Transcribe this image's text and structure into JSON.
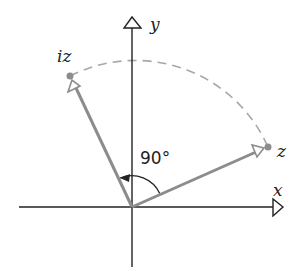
{
  "diagram": {
    "axes": {
      "x_label": "x",
      "y_label": "y"
    },
    "vectors": [
      {
        "label": "z",
        "color": "#8c8c8c"
      },
      {
        "label": "iz",
        "color": "#8c8c8c"
      }
    ],
    "angle_label": "90°",
    "arc_style": "dashed",
    "colors": {
      "axis": "#222222",
      "vector": "#8c8c8c",
      "arc": "#a8a8a8",
      "point": "#8c8c8c"
    }
  }
}
